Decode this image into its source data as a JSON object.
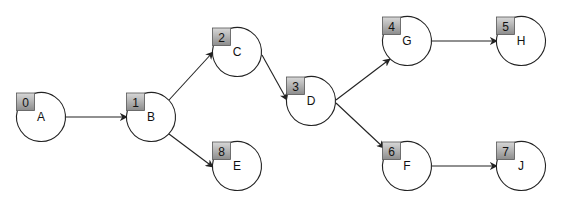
{
  "diagram": {
    "type": "directed-graph",
    "colors": {
      "stroke": "#222222",
      "box_top": "#d8d8d8",
      "box_bottom": "#8c8c8c",
      "background": "#ffffff"
    },
    "nodes": [
      {
        "id": "A",
        "label": "A",
        "index": "0",
        "cx": 41,
        "cy": 117
      },
      {
        "id": "B",
        "label": "B",
        "index": "1",
        "cx": 151,
        "cy": 117
      },
      {
        "id": "C",
        "label": "C",
        "index": "2",
        "cx": 237,
        "cy": 52
      },
      {
        "id": "D",
        "label": "D",
        "index": "3",
        "cx": 311,
        "cy": 101
      },
      {
        "id": "G",
        "label": "G",
        "index": "4",
        "cx": 407,
        "cy": 41
      },
      {
        "id": "H",
        "label": "H",
        "index": "5",
        "cx": 521,
        "cy": 41
      },
      {
        "id": "F",
        "label": "F",
        "index": "6",
        "cx": 407,
        "cy": 166
      },
      {
        "id": "J",
        "label": "J",
        "index": "7",
        "cx": 521,
        "cy": 166
      },
      {
        "id": "E",
        "label": "E",
        "index": "8",
        "cx": 237,
        "cy": 166
      }
    ],
    "edges": [
      {
        "from": "A",
        "to": "B",
        "x1": 65,
        "y1": 117,
        "x2": 127,
        "y2": 117
      },
      {
        "from": "B",
        "to": "C",
        "x1": 169,
        "y1": 100,
        "x2": 213,
        "y2": 52
      },
      {
        "from": "B",
        "to": "E",
        "x1": 169,
        "y1": 134,
        "x2": 213,
        "y2": 167
      },
      {
        "from": "C",
        "to": "D",
        "x1": 262,
        "y1": 55,
        "x2": 287,
        "y2": 100
      },
      {
        "from": "D",
        "to": "G",
        "x1": 336,
        "y1": 100,
        "x2": 390,
        "y2": 59
      },
      {
        "from": "D",
        "to": "F",
        "x1": 336,
        "y1": 103,
        "x2": 384,
        "y2": 148
      },
      {
        "from": "G",
        "to": "H",
        "x1": 431,
        "y1": 41,
        "x2": 497,
        "y2": 41
      },
      {
        "from": "F",
        "to": "J",
        "x1": 432,
        "y1": 166,
        "x2": 497,
        "y2": 166
      }
    ]
  }
}
